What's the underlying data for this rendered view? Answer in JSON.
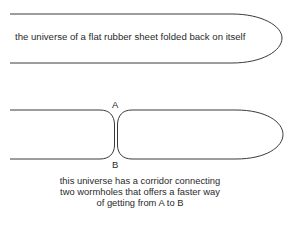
{
  "diagram": {
    "top_panel": {
      "label": "the universe of a flat rubber sheet folded back on itself"
    },
    "bottom_panel": {
      "point_a": "A",
      "point_b": "B",
      "caption_lines": [
        "this universe has a corridor connecting",
        "two wormholes that offers a faster way",
        "of getting from A to B"
      ]
    },
    "colors": {
      "line": "#3a3a3a",
      "text": "#2a2a2a",
      "background": "#ffffff"
    }
  }
}
